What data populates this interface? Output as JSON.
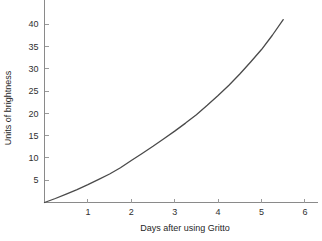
{
  "chart_data": {
    "type": "line",
    "title": "",
    "xlabel": "Days after using Gritto",
    "ylabel": "Units of brightness",
    "xlim": [
      0,
      6.3
    ],
    "ylim": [
      0,
      43
    ],
    "xticks": [
      1,
      2,
      3,
      4,
      5,
      6
    ],
    "xtick_labels": [
      "1",
      "2",
      "3",
      "4",
      "5",
      "6"
    ],
    "yticks": [
      5,
      10,
      15,
      20,
      25,
      30,
      35,
      40
    ],
    "ytick_labels": [
      "5",
      "10",
      "15",
      "20",
      "25",
      "30",
      "35",
      "40"
    ],
    "grid": false,
    "legend": false,
    "line_color": "#4a4a4a",
    "background_color": "#ffffff",
    "axis_color": "#8a8a8a",
    "series": [
      {
        "name": "brightness",
        "x": [
          0,
          0.25,
          0.5,
          0.75,
          1,
          1.25,
          1.5,
          1.75,
          2,
          2.25,
          2.5,
          2.75,
          3,
          3.25,
          3.5,
          3.75,
          4,
          4.25,
          4.5,
          4.75,
          5,
          5.25,
          5.5
        ],
        "y": [
          0,
          0.9,
          1.9,
          2.9,
          4.0,
          5.2,
          6.4,
          7.8,
          9.4,
          11.0,
          12.6,
          14.3,
          16.0,
          17.8,
          19.7,
          21.8,
          24.0,
          26.3,
          28.8,
          31.5,
          34.3,
          37.5,
          41.0
        ]
      }
    ]
  },
  "axis_titles": {
    "x": "Days after using Gritto",
    "y": "Units of brightness"
  }
}
